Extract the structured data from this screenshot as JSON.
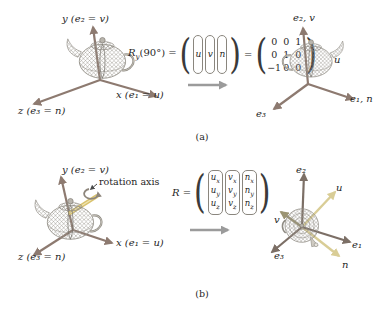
{
  "figure": {
    "caption_a": "(a)",
    "caption_b": "(b)"
  },
  "panel_a": {
    "left": {
      "y_label": "y (e₂ = v)",
      "x_label": "x (e₁ = u)",
      "z_label": "z (e₃ = n)"
    },
    "equation": {
      "r": "R",
      "r_sub": "y",
      "arg": "(90°)",
      "eq1": "=",
      "cols": [
        "u",
        "v",
        "n"
      ],
      "eq2": "=",
      "matrix": [
        [
          "0",
          "0",
          "1"
        ],
        [
          "0",
          "1",
          "0"
        ],
        [
          "−1",
          "0",
          "0"
        ]
      ]
    },
    "right": {
      "e2_label": "e₂, v",
      "u_label": "u",
      "e1_label": "e₁, n",
      "e3_label": "e₃"
    }
  },
  "panel_b": {
    "left": {
      "y_label": "y (e₂ = v)",
      "x_label": "x (e₁ = u)",
      "z_label": "z (e₃ = n)",
      "rotation_label": "rotation axis"
    },
    "equation": {
      "r": "R",
      "eq1": "=",
      "cols": [
        {
          "m": "u",
          "s": [
            "x",
            "y",
            "z"
          ]
        },
        {
          "m": "v",
          "s": [
            "x",
            "y",
            "z"
          ]
        },
        {
          "m": "n",
          "s": [
            "x",
            "y",
            "z"
          ]
        }
      ]
    },
    "right": {
      "e2_label": "e₂",
      "u_label": "u",
      "e1_label": "e₁",
      "e3_label": "e₃",
      "v_label": "v",
      "n_label": "n"
    }
  },
  "colors": {
    "axis_arrow": "#8d7a70",
    "dark_axis_arrow": "#7c6f66",
    "uvn_arrow": "#d9cd96",
    "v_arrow": "#9b9473",
    "rotation_rod": "#d9c26e",
    "flow_arrow": "#9b9b9b",
    "teapot_wire": "#8f8b83",
    "text": "#1f1f1f"
  }
}
